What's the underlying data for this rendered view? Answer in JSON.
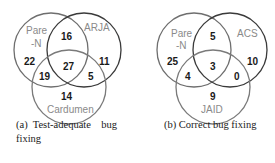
{
  "figure_a": {
    "caption_line1": "(a)  Test-adequate    bug",
    "caption_line2": "fixing",
    "sets": {
      "top_left": "Pare",
      "top_left_2": "-N",
      "top_right": "ARJA",
      "bottom": "Cardumen"
    },
    "regions": {
      "left_only": "22",
      "right_only": "11",
      "bottom_only": "14",
      "left_right": "16",
      "left_bottom": "19",
      "right_bottom": "5",
      "all": "27"
    }
  },
  "figure_b": {
    "caption": "(b) Correct bug fixing",
    "sets": {
      "top_left": "Pare",
      "top_left_2": "-N",
      "top_right": "ACS",
      "bottom": "JAID"
    },
    "regions": {
      "left_only": "25",
      "right_only": "10",
      "bottom_only": "9",
      "left_right": "5",
      "left_bottom": "4",
      "right_bottom": "0",
      "all": "3"
    }
  },
  "colors": {
    "circle_left": "#6e6e6e",
    "circle_right": "#3a3a3a",
    "circle_bottom": "#7a7a7a",
    "label": "#8a8a8a",
    "number": "#1a1a1a"
  }
}
